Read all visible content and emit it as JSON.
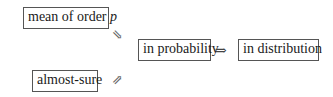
{
  "diagram": {
    "nodes": [
      {
        "id": "mean",
        "label": "mean of order ",
        "label_italic": "p"
      },
      {
        "id": "almost_sure",
        "label": "almost-sure"
      },
      {
        "id": "in_probability",
        "label": "in probability"
      },
      {
        "id": "in_distribution",
        "label": "in distribution"
      }
    ],
    "arrows": [
      {
        "from": "mean",
        "to": "in_probability",
        "glyph": "⇘"
      },
      {
        "from": "almost_sure",
        "to": "in_probability",
        "glyph": "⇗"
      },
      {
        "from": "in_probability",
        "to": "in_distribution",
        "glyph": "⇒"
      }
    ]
  }
}
